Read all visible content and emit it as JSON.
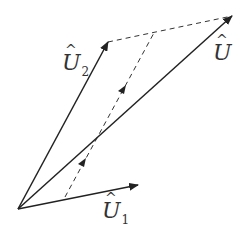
{
  "diagram": {
    "type": "vector-addition",
    "origin": [
      18,
      209
    ],
    "vectors": [
      {
        "name": "U1",
        "label": "U",
        "subscript": "1",
        "hat": "^",
        "tip": [
          138,
          185
        ],
        "style": "solid"
      },
      {
        "name": "U2",
        "label": "U",
        "subscript": "2",
        "hat": "^",
        "tip": [
          108,
          42
        ],
        "style": "solid"
      },
      {
        "name": "U",
        "label": "U",
        "subscript": "",
        "hat": "^",
        "tip": [
          232,
          16
        ],
        "style": "solid"
      }
    ],
    "dashed_lines": [
      {
        "from": [
          108,
          42
        ],
        "to": [
          232,
          16
        ]
      },
      {
        "from": [
          65,
          197
        ],
        "to": [
          155,
          31
        ]
      }
    ],
    "colors": {
      "line": "#222222",
      "label": "#333333"
    }
  }
}
